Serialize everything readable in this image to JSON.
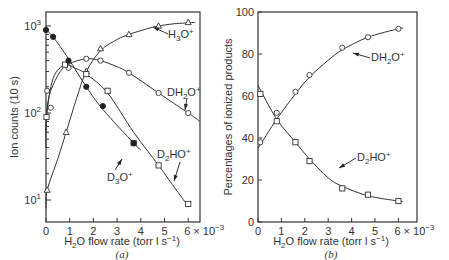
{
  "chart_data": [
    {
      "type": "line",
      "panel_label": "(a)",
      "title": "",
      "xlabel": "H2O flow rate (torr l s^-1)",
      "xlabel_parts": {
        "pre": "H",
        "sub": "2",
        "post": "O flow rate (torr l s",
        "sup": "−1",
        "end": ")"
      },
      "ylabel": "Ion counts (10 s)",
      "yscale": "log",
      "xlim": [
        0,
        6
      ],
      "ylim": [
        8,
        1100
      ],
      "x_ticks": [
        "0",
        "1",
        "2",
        "3",
        "4",
        "5",
        "6"
      ],
      "x_multiplier": "× 10−3",
      "y_ticks": [
        {
          "base": "10",
          "exp": "3",
          "value": 1000
        },
        {
          "base": "10",
          "exp": "2",
          "value": 100
        },
        {
          "base": "10",
          "exp": "1",
          "value": 10
        }
      ],
      "grid": false,
      "series": [
        {
          "name": "H3O+",
          "label": "H₃O⁺",
          "marker": "triangle",
          "x": [
            0.05,
            0.85,
            1.7,
            2.3,
            3.5,
            4.75,
            6.0
          ],
          "y": [
            13,
            60,
            300,
            550,
            800,
            1000,
            1100
          ]
        },
        {
          "name": "DH2O+",
          "label": "DH₂O⁺",
          "marker": "open-circle",
          "x": [
            0.05,
            0.2,
            0.95,
            1.7,
            2.3,
            3.5,
            4.75,
            6.0
          ],
          "y": [
            180,
            115,
            330,
            420,
            400,
            290,
            170,
            100
          ]
        },
        {
          "name": "D2HO+",
          "label": "D₂HO⁺",
          "marker": "square",
          "x": [
            0.02,
            0.8,
            1.7,
            2.6,
            3.7,
            4.75,
            6.0
          ],
          "y": [
            90,
            360,
            280,
            180,
            45,
            25,
            9
          ]
        },
        {
          "name": "D3O+",
          "label": "D₃O⁺",
          "marker": "filled-circle",
          "x": [
            0.0,
            0.3,
            0.95,
            1.7,
            2.4,
            3.7
          ],
          "y": [
            900,
            750,
            400,
            200,
            120,
            45
          ]
        }
      ],
      "annotations": [
        "H₃O⁺",
        "DH₂O⁺",
        "D₂HO⁺",
        "D₃O⁺"
      ]
    },
    {
      "type": "line",
      "panel_label": "(b)",
      "title": "",
      "xlabel": "H2O flow rate (torr l s^-1)",
      "xlabel_parts": {
        "pre": "H",
        "sub": "2",
        "post": "O flow rate (torr l s",
        "sup": "−1",
        "end": ")"
      },
      "ylabel": "Percentages of ionized products",
      "yscale": "linear",
      "xlim": [
        0,
        6
      ],
      "ylim": [
        0,
        100
      ],
      "x_ticks": [
        "0",
        "1",
        "2",
        "3",
        "4",
        "5",
        "6"
      ],
      "x_multiplier": "× 10−3",
      "y_ticks": [
        "0",
        "20",
        "40",
        "60",
        "80",
        "100"
      ],
      "grid": false,
      "series": [
        {
          "name": "DH2O+",
          "label": "DH₂O⁺",
          "marker": "open-circle",
          "x": [
            0.1,
            0.8,
            1.6,
            2.2,
            3.6,
            4.7,
            6.0
          ],
          "y": [
            38,
            52,
            62,
            70,
            83,
            88,
            92
          ]
        },
        {
          "name": "D2HO+",
          "label": "D₂HO⁺",
          "marker": "square",
          "x": [
            0.1,
            0.8,
            1.6,
            2.2,
            3.6,
            4.7,
            6.0
          ],
          "y": [
            61,
            48,
            38,
            29,
            16,
            13,
            10
          ]
        }
      ],
      "annotations": [
        "DH₂O⁺",
        "D₂HO⁺"
      ]
    }
  ],
  "labels": {
    "a_panel": "(a)",
    "b_panel": "(b)",
    "a_ylabel": "Ion counts (10 s)",
    "b_ylabel": "Percentages of ionized products",
    "x_mult_base": "6 × 10",
    "x_mult_exp": "−3",
    "h3o": "H₃O⁺",
    "dh2o": "DH₂O⁺",
    "d2ho": "D₂HO⁺",
    "d3o": "D₃O⁺"
  }
}
